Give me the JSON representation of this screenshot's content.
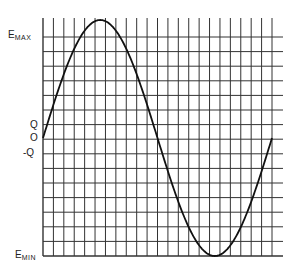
{
  "chart_data": {
    "type": "line",
    "title": "",
    "xlabel": "",
    "ylabel": "",
    "y_tick_labels": [
      {
        "label": "E",
        "sub": "MAX",
        "value": "Emax"
      },
      {
        "label": "Q",
        "sub": "",
        "value": "Q"
      },
      {
        "label": "O",
        "sub": "",
        "value": "0"
      },
      {
        "label": "-Q",
        "sub": "",
        "value": "-Q"
      },
      {
        "label": "E",
        "sub": "MIN",
        "value": "Emin"
      }
    ],
    "grid": true,
    "grid_columns": 22,
    "grid_rows": 15,
    "series": [
      {
        "name": "waveform",
        "color": "#111111",
        "x": [
          0,
          45,
          90,
          135,
          180,
          225,
          270,
          315,
          360
        ],
        "y": [
          0,
          0.71,
          1.0,
          0.71,
          0,
          -0.71,
          -1.0,
          -0.71,
          0
        ]
      }
    ],
    "ylim": [
      "Emin",
      "Emax"
    ]
  },
  "labels": {
    "emax_main": "E",
    "emax_sub": "MAX",
    "q": "Q",
    "zero": "O",
    "neg_q": "-Q",
    "emin_main": "E",
    "emin_sub": "MIN"
  },
  "colors": {
    "grid": "#333333",
    "curve": "#111111",
    "background": "#ffffff"
  }
}
